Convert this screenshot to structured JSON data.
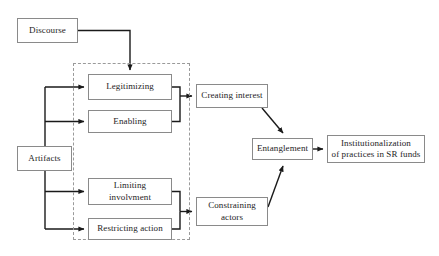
{
  "diagram": {
    "background_color": "#ffffff",
    "node_border_color": "#8a8a8a",
    "group_border_color": "#9a9a9a",
    "connector_color": "#1a1a1a",
    "nodes": {
      "discourse": {
        "label": "Discourse"
      },
      "artifacts": {
        "label": "Artifacts"
      },
      "legitimizing": {
        "label": "Legitimizing"
      },
      "enabling": {
        "label": "Enabling"
      },
      "limiting_involvment": {
        "label": "Limiting\ninvolvment"
      },
      "restricting_action": {
        "label": "Restricting action"
      },
      "creating_interest": {
        "label": "Creating interest"
      },
      "constraining_actors": {
        "label": "Constraining\nactors"
      },
      "entanglement": {
        "label": "Entanglement"
      },
      "institutionalization": {
        "label": "Institutionalization\nof practices in SR funds"
      }
    },
    "group": {
      "name": "mechanisms-group",
      "label": ""
    }
  }
}
